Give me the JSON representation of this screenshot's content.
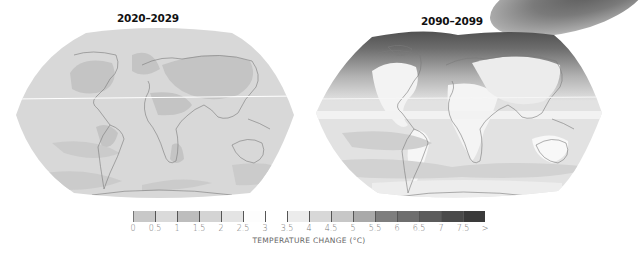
{
  "maps": [
    {
      "title": "2020–2029",
      "period": "2020-2029",
      "ocean_fill": "#d8d8d8",
      "warm_region_fill": "#c4c4c4",
      "description": "Projected surface temperature change, mostly 0.5–2 °C; continents slightly warmer"
    },
    {
      "title": "2090–2099",
      "period": "2090-2099",
      "ocean_fill": "#e2e2e2",
      "warm_region_fill": "#f4f4f4",
      "arctic_fill": "#555555",
      "description": "Projected surface temperature change, strongest over Arctic (>7.5 °C), land 3–5 °C"
    }
  ],
  "legend": {
    "title": "TEMPERATURE CHANGE (°C)",
    "tick_labels": [
      "0",
      "0.5",
      "1",
      "1.5",
      "2",
      "2.5",
      "3",
      "3.5",
      "4",
      "4.5",
      "5",
      "5.5",
      "6",
      "6.5",
      "7",
      "7.5",
      ">"
    ],
    "swatch_colors": [
      "#c8c8c8",
      "#dadada",
      "#bdbdbd",
      "#d4d4d4",
      "#e4e4e4",
      "#fdfdfd",
      "#ffffff",
      "#ececec",
      "#d8d8d8",
      "#c7c7c7",
      "#a9a9a9",
      "#7e7e7e",
      "#6e6e6e",
      "#5c5c5c",
      "#4a4a4a",
      "#3a3a3a"
    ]
  }
}
